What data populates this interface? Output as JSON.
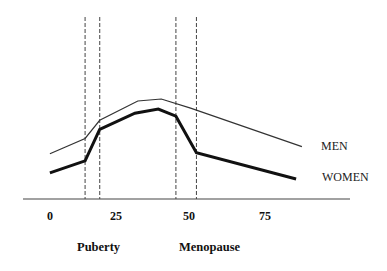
{
  "chart_data": {
    "type": "line",
    "title": "",
    "xlabel": "",
    "ylabel": "",
    "x_ticks": [
      "0",
      "25",
      "50",
      "75"
    ],
    "xlim": [
      0,
      90
    ],
    "y_axis_shown": false,
    "grid": false,
    "legend_position": "inline-right",
    "series": [
      {
        "name": "MEN",
        "style": "thin",
        "x": [
          1,
          13,
          18,
          31,
          39,
          49,
          87
        ],
        "y": [
          46,
          61,
          79,
          98,
          100,
          91,
          53
        ]
      },
      {
        "name": "WOMEN",
        "style": "thick",
        "x": [
          1,
          13,
          18,
          30,
          38,
          44,
          51,
          85
        ],
        "y": [
          27,
          39,
          70,
          86,
          90,
          83,
          47,
          21
        ]
      }
    ],
    "reference_lines": [
      {
        "x": 13,
        "style": "dashed",
        "group": "Puberty"
      },
      {
        "x": 18,
        "style": "dashed",
        "group": "Puberty"
      },
      {
        "x": 44,
        "style": "dashed",
        "group": "Menopause"
      },
      {
        "x": 51,
        "style": "dashed",
        "group": "Menopause"
      }
    ],
    "annotations": [
      "Puberty",
      "Menopause"
    ],
    "y_units": "relative (unlabeled)"
  },
  "labels": {
    "ticks": [
      "0",
      "25",
      "50",
      "75"
    ],
    "men": "MEN",
    "women": "WOMEN",
    "puberty": "Puberty",
    "menopause": "Menopause"
  }
}
